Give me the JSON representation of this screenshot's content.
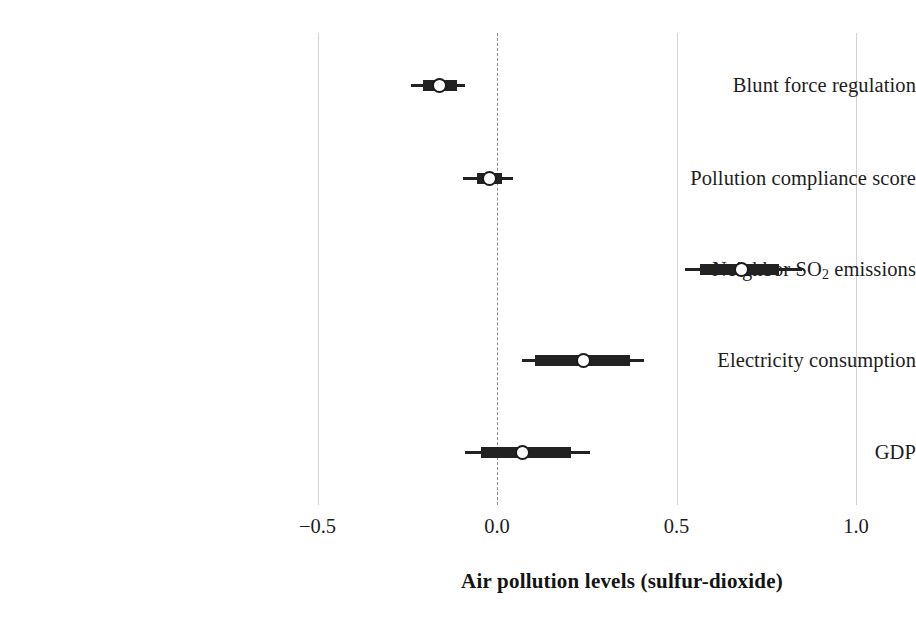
{
  "chart_data": {
    "type": "scatter",
    "title": "",
    "xlabel": "Air pollution levels (sulfur-dioxide)",
    "ylabel": "",
    "xlim": [
      -0.62,
      1.1
    ],
    "xticks": [
      -0.5,
      0.0,
      0.5,
      1.0
    ],
    "xticklabels": [
      "−0.5",
      "0.0",
      "0.5",
      "1.0"
    ],
    "grid": "vertical",
    "zero_reference_line": 0.0,
    "legend": "none",
    "orientation": "horizontal",
    "categories": [
      "Blunt force regulation",
      "Pollution compliance score",
      "Neighbor SO2 emissions",
      "Electricity consumption",
      "GDP"
    ],
    "estimates": [
      -0.16,
      -0.02,
      0.68,
      0.24,
      0.07
    ],
    "inner_ci_low": [
      -0.205,
      -0.055,
      0.565,
      0.105,
      -0.045
    ],
    "inner_ci_high": [
      -0.11,
      0.015,
      0.785,
      0.37,
      0.205
    ],
    "outer_ci_low": [
      -0.24,
      -0.095,
      0.525,
      0.07,
      -0.09
    ],
    "outer_ci_high": [
      -0.09,
      0.045,
      0.85,
      0.41,
      0.26
    ]
  },
  "axis": {
    "title": "Air pollution levels (sulfur-dioxide)",
    "ticks": [
      {
        "value": -0.5,
        "label": "−0.5"
      },
      {
        "value": 0.0,
        "label": "0.0"
      },
      {
        "value": 0.5,
        "label": "0.5"
      },
      {
        "value": 1.0,
        "label": "1.0"
      }
    ]
  },
  "rows": [
    {
      "label_html": "Blunt force regulation",
      "label": "Blunt force regulation"
    },
    {
      "label_html": "Pollution compliance score",
      "label": "Pollution compliance score"
    },
    {
      "label_html": "Neighbor SO<sub>2</sub> emissions",
      "label": "Neighbor SO2 emissions"
    },
    {
      "label_html": "Electricity consumption",
      "label": "Electricity consumption"
    },
    {
      "label_html": "GDP",
      "label": "GDP"
    }
  ],
  "colors": {
    "background": "#ffffff",
    "text": "#1d1d1d",
    "marker": "#1b1b1b",
    "interval": "#222222",
    "gridline": "#d2d2d2",
    "zero_line": "#8d8d8d"
  },
  "layout": {
    "plot_left_px": 290,
    "plot_right_px": 890,
    "grid_top_px": 33,
    "grid_bottom_px": 505,
    "row_y_px": [
      85,
      178,
      269,
      360,
      452
    ],
    "label_right_px": 282,
    "tick_label_y_px": 516,
    "axis_title_y_px": 569,
    "axis_title_center_px": 622,
    "px_per_unit": 359,
    "zero_x_px": 497
  }
}
